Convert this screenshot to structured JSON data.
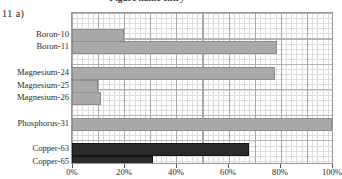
{
  "figure": {
    "number_label": "11 a)",
    "title_clipped": "Figure  name  entry"
  },
  "chart_data": {
    "type": "bar",
    "orientation": "horizontal",
    "title": "",
    "xlabel": "",
    "ylabel": "",
    "xlim": [
      0,
      100
    ],
    "xunit": "%",
    "grid": true,
    "legend": "none",
    "xticks": [
      0,
      20,
      40,
      60,
      80,
      100
    ],
    "xticklabels": [
      "0%",
      "20%",
      "40%",
      "60%",
      "80%",
      "100%"
    ],
    "categories": [
      "Boron-10",
      "Boron-11",
      "Magnesium-24",
      "Magnesium-25",
      "Magnesium-26",
      "Phosphorus-31",
      "Copper-63",
      "Copper-65"
    ],
    "values": [
      20,
      79,
      78,
      10,
      11,
      100,
      68,
      31
    ],
    "bar_colors": [
      "#a9a9a9",
      "#a9a9a9",
      "#a9a9a9",
      "#a9a9a9",
      "#a9a9a9",
      "#a9a9a9",
      "#2a2a2a",
      "#2a2a2a"
    ],
    "bars": [
      {
        "label": "Boron-10",
        "value": 20,
        "row": 1,
        "color": "#a9a9a9"
      },
      {
        "label": "Boron-11",
        "value": 79,
        "row": 2,
        "color": "#a9a9a9"
      },
      {
        "label": "Magnesium-24",
        "value": 78,
        "row": 4,
        "color": "#a9a9a9"
      },
      {
        "label": "Magnesium-25",
        "value": 10,
        "row": 5,
        "color": "#a9a9a9"
      },
      {
        "label": "Magnesium-26",
        "value": 11,
        "row": 6,
        "color": "#a9a9a9"
      },
      {
        "label": "Phosphorus-31",
        "value": 100,
        "row": 8,
        "color": "#a9a9a9"
      },
      {
        "label": "Copper-63",
        "value": 68,
        "row": 10,
        "color": "#2a2a2a"
      },
      {
        "label": "Copper-65",
        "value": 31,
        "row": 11,
        "color": "#2a2a2a"
      }
    ]
  }
}
